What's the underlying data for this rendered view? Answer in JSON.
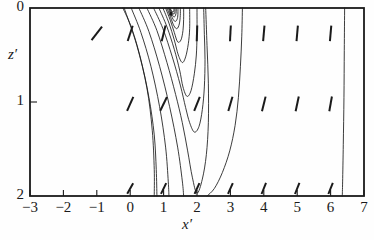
{
  "figure": {
    "kind": "contour-plot-with-vectors",
    "background_color": "#fefefe",
    "line_color": "#1a1a1a",
    "frame": {
      "left_px": 30,
      "top_px": 8,
      "right_px": 364,
      "bottom_px": 196
    }
  },
  "axes": {
    "x": {
      "title": "x",
      "prime": "′",
      "min": -3,
      "max": 7,
      "ticks": [
        -3,
        -2,
        -1,
        0,
        1,
        2,
        3,
        4,
        5,
        6,
        7
      ],
      "tick_labels": [
        "−3",
        "−2",
        "−1",
        "0",
        "1",
        "2",
        "3",
        "4",
        "5",
        "6",
        "7"
      ],
      "tick_side": "bottom-inside"
    },
    "y": {
      "title": "z",
      "prime": "′",
      "min": 0,
      "max": 2,
      "inverted": true,
      "ticks": [
        0,
        1,
        2
      ],
      "tick_labels": [
        "0",
        "1",
        "2"
      ],
      "tick_side": "left-inside"
    }
  },
  "chart_data": {
    "type": "line",
    "title": "",
    "xlabel": "x′",
    "ylabel": "z′",
    "xlim": [
      -3,
      7
    ],
    "ylim": [
      2,
      0
    ],
    "grid": false,
    "legend": "none",
    "contour_focus": {
      "x": 1.22,
      "z": 0.06
    },
    "contours": [
      {
        "name": "c1-outer-fan",
        "points": [
          [
            -0.22,
            0.0
          ],
          [
            0.05,
            0.22
          ],
          [
            0.32,
            0.55
          ],
          [
            0.56,
            0.95
          ],
          [
            0.72,
            1.35
          ],
          [
            0.78,
            1.72
          ],
          [
            0.8,
            2.0
          ]
        ]
      },
      {
        "name": "c2-fan",
        "points": [
          [
            0.03,
            0.0
          ],
          [
            0.32,
            0.26
          ],
          [
            0.62,
            0.62
          ],
          [
            0.88,
            1.05
          ],
          [
            1.06,
            1.48
          ],
          [
            1.14,
            1.85
          ],
          [
            1.16,
            2.0
          ]
        ]
      },
      {
        "name": "c3-fan",
        "points": [
          [
            0.26,
            0.0
          ],
          [
            0.56,
            0.25
          ],
          [
            0.88,
            0.62
          ],
          [
            1.18,
            1.05
          ],
          [
            1.42,
            1.48
          ],
          [
            1.56,
            1.84
          ],
          [
            1.6,
            2.0
          ]
        ]
      },
      {
        "name": "c4-loop",
        "points": [
          [
            0.5,
            0.0
          ],
          [
            0.8,
            0.24
          ],
          [
            1.1,
            0.58
          ],
          [
            1.36,
            0.92
          ],
          [
            1.56,
            1.22
          ],
          [
            1.72,
            1.52
          ],
          [
            1.86,
            1.8
          ],
          [
            2.0,
            1.97
          ],
          [
            2.16,
            1.82
          ],
          [
            2.28,
            1.56
          ],
          [
            2.34,
            1.22
          ],
          [
            2.34,
            0.8
          ],
          [
            2.3,
            0.4
          ],
          [
            2.26,
            0.0
          ]
        ]
      },
      {
        "name": "c5-loop",
        "points": [
          [
            0.7,
            0.0
          ],
          [
            0.98,
            0.22
          ],
          [
            1.26,
            0.52
          ],
          [
            1.5,
            0.82
          ],
          [
            1.66,
            1.06
          ],
          [
            1.78,
            1.22
          ],
          [
            1.92,
            1.32
          ],
          [
            2.06,
            1.26
          ],
          [
            2.16,
            1.08
          ],
          [
            2.22,
            0.84
          ],
          [
            2.24,
            0.55
          ],
          [
            2.22,
            0.28
          ],
          [
            2.2,
            0.0
          ]
        ]
      },
      {
        "name": "c6-loop",
        "points": [
          [
            0.86,
            0.0
          ],
          [
            1.1,
            0.2
          ],
          [
            1.32,
            0.44
          ],
          [
            1.48,
            0.66
          ],
          [
            1.58,
            0.84
          ],
          [
            1.7,
            0.94
          ],
          [
            1.82,
            0.88
          ],
          [
            1.92,
            0.7
          ],
          [
            1.98,
            0.5
          ],
          [
            2.0,
            0.28
          ],
          [
            2.0,
            0.0
          ]
        ]
      },
      {
        "name": "c7-loop",
        "points": [
          [
            0.98,
            0.0
          ],
          [
            1.16,
            0.16
          ],
          [
            1.32,
            0.34
          ],
          [
            1.44,
            0.5
          ],
          [
            1.56,
            0.58
          ],
          [
            1.66,
            0.52
          ],
          [
            1.74,
            0.38
          ],
          [
            1.78,
            0.22
          ],
          [
            1.78,
            0.0
          ]
        ]
      },
      {
        "name": "c8-loop",
        "points": [
          [
            1.06,
            0.0
          ],
          [
            1.2,
            0.13
          ],
          [
            1.32,
            0.26
          ],
          [
            1.42,
            0.36
          ],
          [
            1.52,
            0.34
          ],
          [
            1.58,
            0.24
          ],
          [
            1.6,
            0.12
          ],
          [
            1.6,
            0.0
          ]
        ]
      },
      {
        "name": "c9-loop",
        "points": [
          [
            1.1,
            0.0
          ],
          [
            1.21,
            0.1
          ],
          [
            1.31,
            0.19
          ],
          [
            1.4,
            0.22
          ],
          [
            1.47,
            0.17
          ],
          [
            1.5,
            0.08
          ],
          [
            1.5,
            0.0
          ]
        ]
      },
      {
        "name": "c10-loop",
        "points": [
          [
            1.14,
            0.0
          ],
          [
            1.22,
            0.07
          ],
          [
            1.3,
            0.13
          ],
          [
            1.37,
            0.14
          ],
          [
            1.42,
            0.1
          ],
          [
            1.43,
            0.04
          ],
          [
            1.43,
            0.0
          ]
        ]
      },
      {
        "name": "c11-loop",
        "points": [
          [
            1.16,
            0.0
          ],
          [
            1.23,
            0.05
          ],
          [
            1.29,
            0.09
          ],
          [
            1.34,
            0.09
          ],
          [
            1.37,
            0.06
          ],
          [
            1.38,
            0.02
          ],
          [
            1.38,
            0.0
          ]
        ]
      },
      {
        "name": "c12-loop",
        "points": [
          [
            1.18,
            0.0
          ],
          [
            1.23,
            0.035
          ],
          [
            1.28,
            0.06
          ],
          [
            1.32,
            0.06
          ],
          [
            1.34,
            0.035
          ],
          [
            1.34,
            0.0
          ]
        ]
      },
      {
        "name": "c13-loop",
        "points": [
          [
            1.19,
            0.0
          ],
          [
            1.23,
            0.025
          ],
          [
            1.27,
            0.04
          ],
          [
            1.3,
            0.04
          ],
          [
            1.31,
            0.02
          ],
          [
            1.31,
            0.0
          ]
        ]
      },
      {
        "name": "c-sep-left",
        "points": [
          [
            -0.18,
            0.0
          ],
          [
            0.2,
            0.4
          ],
          [
            0.5,
            0.85
          ],
          [
            0.66,
            1.3
          ],
          [
            0.72,
            1.72
          ],
          [
            0.72,
            2.0
          ]
        ]
      },
      {
        "name": "c-vert-right-a",
        "points": [
          [
            3.36,
            0.0
          ],
          [
            3.34,
            0.3
          ],
          [
            3.3,
            0.62
          ],
          [
            3.24,
            0.95
          ],
          [
            3.14,
            1.25
          ],
          [
            2.98,
            1.52
          ],
          [
            2.76,
            1.75
          ],
          [
            2.52,
            1.92
          ],
          [
            2.3,
            2.0
          ]
        ]
      },
      {
        "name": "c-vert-right-b",
        "points": [
          [
            6.42,
            0.0
          ],
          [
            6.41,
            0.45
          ],
          [
            6.4,
            0.95
          ],
          [
            6.38,
            1.45
          ],
          [
            6.36,
            1.85
          ],
          [
            6.35,
            2.0
          ]
        ]
      }
    ],
    "vectors": [
      {
        "x": -1.0,
        "z": 0.27,
        "angle_deg": 38,
        "len": 1.0
      },
      {
        "x": 0.0,
        "z": 0.27,
        "angle_deg": 18,
        "len": 0.95
      },
      {
        "x": 1.0,
        "z": 0.27,
        "angle_deg": 14,
        "len": 0.95
      },
      {
        "x": 2.0,
        "z": 0.27,
        "angle_deg": 2,
        "len": 0.92
      },
      {
        "x": 3.0,
        "z": 0.27,
        "angle_deg": 3,
        "len": 0.92
      },
      {
        "x": 4.0,
        "z": 0.27,
        "angle_deg": 5,
        "len": 0.92
      },
      {
        "x": 5.0,
        "z": 0.27,
        "angle_deg": 5,
        "len": 0.92
      },
      {
        "x": 6.0,
        "z": 0.27,
        "angle_deg": 5,
        "len": 0.92
      },
      {
        "x": 0.0,
        "z": 1.02,
        "angle_deg": 24,
        "len": 0.9
      },
      {
        "x": 1.0,
        "z": 1.02,
        "angle_deg": 26,
        "len": 0.9
      },
      {
        "x": 2.0,
        "z": 1.02,
        "angle_deg": 22,
        "len": 0.88
      },
      {
        "x": 3.0,
        "z": 1.02,
        "angle_deg": 16,
        "len": 0.88
      },
      {
        "x": 4.0,
        "z": 1.02,
        "angle_deg": 14,
        "len": 0.88
      },
      {
        "x": 5.0,
        "z": 1.02,
        "angle_deg": 12,
        "len": 0.88
      },
      {
        "x": 6.0,
        "z": 1.02,
        "angle_deg": 10,
        "len": 0.88
      },
      {
        "x": 0.0,
        "z": 1.92,
        "angle_deg": 30,
        "len": 0.7
      },
      {
        "x": 1.0,
        "z": 1.92,
        "angle_deg": 26,
        "len": 0.7
      },
      {
        "x": 2.0,
        "z": 1.92,
        "angle_deg": 24,
        "len": 0.7
      },
      {
        "x": 3.0,
        "z": 1.92,
        "angle_deg": 24,
        "len": 0.7
      },
      {
        "x": 4.0,
        "z": 1.92,
        "angle_deg": 22,
        "len": 0.7
      },
      {
        "x": 5.0,
        "z": 1.92,
        "angle_deg": 22,
        "len": 0.7
      },
      {
        "x": 6.0,
        "z": 1.92,
        "angle_deg": 22,
        "len": 0.7
      }
    ]
  }
}
